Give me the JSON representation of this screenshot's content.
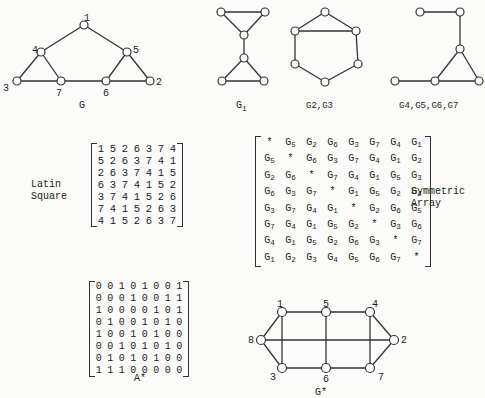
{
  "graph_G": {
    "caption": "G",
    "vertex_labels": [
      "1",
      "2",
      "3",
      "4",
      "5",
      "6",
      "7"
    ]
  },
  "subgraphs": {
    "g1_caption_main": "G",
    "g1_caption_sub": "1",
    "g23_caption": "G2,G3",
    "g4567_caption": "G4,G5,G6,G7"
  },
  "latin_square": {
    "label_line1": "Latin",
    "label_line2": "Square",
    "rows": [
      [
        "1",
        "5",
        "2",
        "6",
        "3",
        "7",
        "4"
      ],
      [
        "5",
        "2",
        "6",
        "3",
        "7",
        "4",
        "1"
      ],
      [
        "2",
        "6",
        "3",
        "7",
        "4",
        "1",
        "5"
      ],
      [
        "6",
        "3",
        "7",
        "4",
        "1",
        "5",
        "2"
      ],
      [
        "3",
        "7",
        "4",
        "1",
        "5",
        "2",
        "6"
      ],
      [
        "7",
        "4",
        "1",
        "5",
        "2",
        "6",
        "3"
      ],
      [
        "4",
        "1",
        "5",
        "2",
        "6",
        "3",
        "7"
      ]
    ]
  },
  "symmetric_array": {
    "label_line1": "Symmetric",
    "label_line2": "Array",
    "rows": [
      [
        "*",
        "G5",
        "G2",
        "G6",
        "G3",
        "G7",
        "G4",
        "G1"
      ],
      [
        "G5",
        "*",
        "G6",
        "G3",
        "G7",
        "G4",
        "G1",
        "G2"
      ],
      [
        "G2",
        "G6",
        "*",
        "G7",
        "G4",
        "G1",
        "G5",
        "G3"
      ],
      [
        "G6",
        "G3",
        "G7",
        "*",
        "G1",
        "G5",
        "G2",
        "G4"
      ],
      [
        "G3",
        "G7",
        "G4",
        "G1",
        "*",
        "G2",
        "G6",
        "G5"
      ],
      [
        "G7",
        "G4",
        "G1",
        "G5",
        "G2",
        "*",
        "G3",
        "G6"
      ],
      [
        "G4",
        "G1",
        "G5",
        "G2",
        "G6",
        "G3",
        "*",
        "G7"
      ],
      [
        "G1",
        "G2",
        "G3",
        "G4",
        "G5",
        "G6",
        "G7",
        "*"
      ]
    ]
  },
  "adjacency_matrix": {
    "caption": "A*",
    "rows": [
      [
        "0",
        "0",
        "1",
        "0",
        "1",
        "0",
        "0",
        "1"
      ],
      [
        "0",
        "0",
        "0",
        "1",
        "0",
        "0",
        "1",
        "1"
      ],
      [
        "1",
        "0",
        "0",
        "0",
        "0",
        "1",
        "0",
        "1"
      ],
      [
        "0",
        "1",
        "0",
        "0",
        "1",
        "0",
        "1",
        "0"
      ],
      [
        "1",
        "0",
        "0",
        "1",
        "0",
        "1",
        "0",
        "0"
      ],
      [
        "0",
        "0",
        "1",
        "0",
        "1",
        "0",
        "1",
        "0"
      ],
      [
        "0",
        "1",
        "0",
        "1",
        "0",
        "1",
        "0",
        "0"
      ],
      [
        "1",
        "1",
        "1",
        "0",
        "0",
        "0",
        "0",
        "0"
      ]
    ]
  },
  "graph_G_star": {
    "caption": "G*",
    "vertex_labels": [
      "1",
      "2",
      "3",
      "4",
      "5",
      "6",
      "7",
      "8"
    ]
  }
}
